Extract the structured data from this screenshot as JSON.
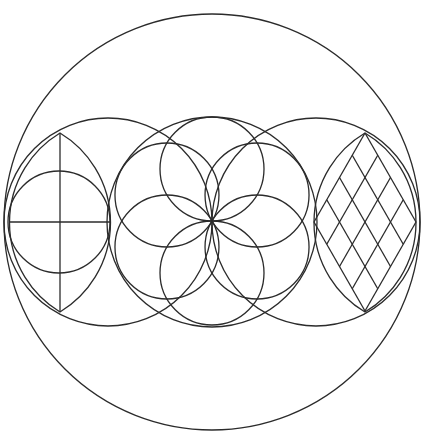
{
  "diagram": {
    "title": "",
    "stroke_color": "#2b2b2b",
    "background": "#ffffff",
    "outer_circle": {
      "cx": 212,
      "cy": 222,
      "r": 208
    },
    "row_circles": [
      {
        "cx": 108,
        "cy": 222,
        "r": 104
      },
      {
        "cx": 212,
        "cy": 222,
        "r": 105
      },
      {
        "cx": 316,
        "cy": 222,
        "r": 104
      }
    ],
    "left_motif": {
      "name": "vesica-with-cross",
      "inner_circle": {
        "cx": 59,
        "cy": 222,
        "r": 51
      },
      "lens": {
        "top": [
          60,
          133
        ],
        "bottom": [
          60,
          312
        ],
        "left": [
          9,
          222
        ],
        "right": [
          110,
          222
        ]
      },
      "cross": {
        "vertical": [
          [
            60,
            133
          ],
          [
            60,
            312
          ]
        ],
        "horizontal": [
          [
            9,
            222
          ],
          [
            110,
            222
          ]
        ]
      }
    },
    "center_motif": {
      "name": "seed-of-life",
      "center": [
        212,
        221
      ],
      "petal_radius": 52,
      "petal_count": 6
    },
    "right_motif": {
      "name": "vesica-with-diamond-grid",
      "lens": {
        "top": [
          365,
          133
        ],
        "bottom": [
          365,
          312
        ],
        "left": [
          314,
          222
        ],
        "right": [
          416,
          222
        ]
      },
      "grid_divisions": 4
    }
  }
}
